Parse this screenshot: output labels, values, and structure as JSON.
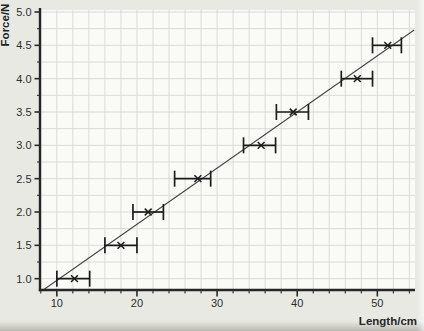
{
  "figure": {
    "background": "#e9e9e4",
    "plot_background": "#fafaf7",
    "grid_color": "#d6d8d2",
    "axis_color": "#262626",
    "tick_color": "#2b2b2b",
    "tick_label_color": "#2e2e2e",
    "point_color": "#1c1c1c",
    "fit_line_color": "#464646"
  },
  "chart_data": {
    "type": "scatter",
    "title": "",
    "xlabel": "Length/cm",
    "ylabel": "Force/N",
    "xlim": [
      7.9,
      54.7
    ],
    "ylim": [
      0.83,
      5.03
    ],
    "grid": "on",
    "grid_minor": {
      "x_start": 8,
      "x_end": 54,
      "x_step": 2,
      "y_start": 1.0,
      "y_end": 5.0,
      "y_step": 0.25
    },
    "x_major_ticks": [
      {
        "value": 10,
        "label": "10"
      },
      {
        "value": 20,
        "label": "20"
      },
      {
        "value": 30,
        "label": "30"
      },
      {
        "value": 40,
        "label": "40"
      },
      {
        "value": 50,
        "label": "50"
      }
    ],
    "y_major_ticks": [
      {
        "value": 1.0,
        "label": "1.0"
      },
      {
        "value": 1.5,
        "label": "1.5"
      },
      {
        "value": 2.0,
        "label": "2.0"
      },
      {
        "value": 2.5,
        "label": "2.5"
      },
      {
        "value": 3.0,
        "label": "3.0"
      },
      {
        "value": 3.5,
        "label": "3.5"
      },
      {
        "value": 4.0,
        "label": "4.0"
      },
      {
        "value": 4.5,
        "label": "4.5"
      },
      {
        "value": 5.0,
        "label": "5.0"
      }
    ],
    "marker": "x",
    "error_bars": "horizontal",
    "points": [
      {
        "x": 12.2,
        "y": 1.0,
        "x_min": 10.0,
        "x_max": 14.1
      },
      {
        "x": 18.0,
        "y": 1.5,
        "x_min": 16.0,
        "x_max": 20.0
      },
      {
        "x": 21.4,
        "y": 2.0,
        "x_min": 19.5,
        "x_max": 23.3
      },
      {
        "x": 27.6,
        "y": 2.5,
        "x_min": 24.7,
        "x_max": 29.2
      },
      {
        "x": 35.5,
        "y": 3.0,
        "x_min": 33.3,
        "x_max": 37.3
      },
      {
        "x": 39.5,
        "y": 3.5,
        "x_min": 37.4,
        "x_max": 41.4
      },
      {
        "x": 47.5,
        "y": 4.0,
        "x_min": 45.5,
        "x_max": 49.4
      },
      {
        "x": 51.3,
        "y": 4.5,
        "x_min": 49.4,
        "x_max": 53.0
      }
    ],
    "fit_line": {
      "x1": 8.3,
      "y1": 0.83,
      "x2": 54.6,
      "y2": 4.73
    }
  }
}
